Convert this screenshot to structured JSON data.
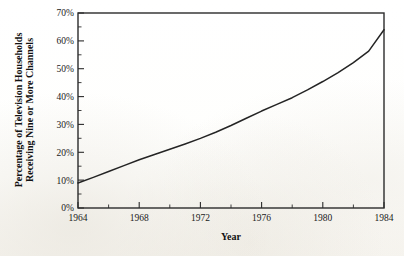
{
  "chart_data": {
    "type": "line",
    "title": "",
    "xlabel": "Year",
    "ylabel": "Percentage of Television Households Receiving Nine or More Channels",
    "ylabel_line1": "Percentage of Television Households",
    "ylabel_line2": "Receiving Nine or More Channels",
    "xlim": [
      1964,
      1984
    ],
    "ylim": [
      0,
      70
    ],
    "grid": false,
    "legend": false,
    "legend_position": "none",
    "x_tick_labels": [
      "1964",
      "1968",
      "1972",
      "1976",
      "1980",
      "1984"
    ],
    "x_ticks": [
      1964,
      1968,
      1972,
      1976,
      1980,
      1984
    ],
    "x_minor_ticks": [
      1966,
      1970,
      1974,
      1978,
      1982
    ],
    "y_tick_labels": [
      "0%",
      "10%",
      "20%",
      "30%",
      "40%",
      "50%",
      "60%",
      "70%"
    ],
    "y_ticks": [
      0,
      10,
      20,
      30,
      40,
      50,
      60,
      70
    ],
    "line_color": "#242424",
    "series": [
      {
        "name": "Percentage of Television Households Receiving Nine or More Channels",
        "x": [
          1964,
          1965,
          1966,
          1967,
          1968,
          1969,
          1970,
          1971,
          1972,
          1973,
          1974,
          1975,
          1976,
          1977,
          1978,
          1979,
          1980,
          1981,
          1982,
          1983,
          1984
        ],
        "values": [
          9.0,
          11.0,
          13.1,
          15.2,
          17.3,
          19.2,
          21.1,
          23.0,
          25.0,
          27.2,
          29.6,
          32.2,
          34.8,
          37.2,
          39.6,
          42.4,
          45.4,
          48.6,
          52.2,
          56.3,
          64.0
        ]
      }
    ]
  },
  "axes": {
    "x_axis_name": "year-axis",
    "y_axis_name": "percentage-axis"
  }
}
